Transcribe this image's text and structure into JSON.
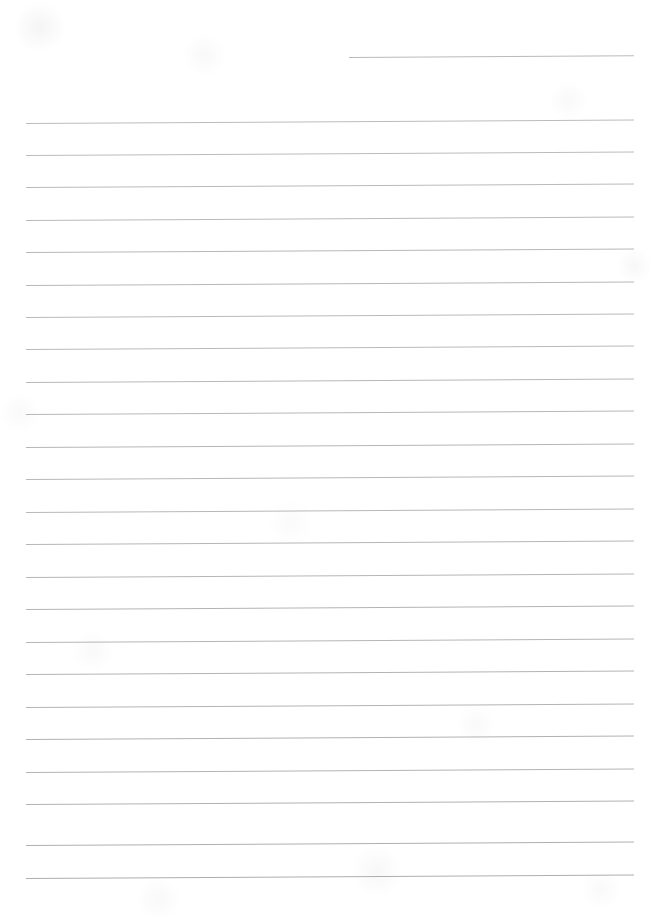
{
  "document": {
    "type": "scanned-ruled-paper",
    "title": "Blank ruled notebook page",
    "page_width": 661,
    "page_height": 917,
    "background_color": "#ffffff",
    "orientation": "portrait",
    "content_text": "",
    "handwriting_present": false
  },
  "ruling": {
    "style": "horizontal ruled lines",
    "line_color": "#b9b9bd",
    "line_color_faint": "#cfcfd4",
    "line_thickness_px": 1,
    "line_count_total": 25,
    "full_width_line_count": 24,
    "partial_line_count": 1,
    "left_margin_px": 26,
    "right_edge_px": 633,
    "line_spacing_px": 32.3,
    "first_line_y_px": 56,
    "last_line_y_px": 877,
    "skew_note": "lines tilt slightly upward to the right",
    "skew_rise_px": -3.5,
    "top_margin_px": 56,
    "bottom_margin_px": 40,
    "lines": [
      {
        "index": 1,
        "x": 349,
        "y": 57,
        "width": 285,
        "color": "#b9b9bd",
        "partial": true
      },
      {
        "index": 2,
        "x": 26,
        "y": 123,
        "width": 608,
        "color": "#bcbcc0",
        "partial": false
      },
      {
        "index": 3,
        "x": 26,
        "y": 155,
        "width": 608,
        "color": "#bcbcc0",
        "partial": false
      },
      {
        "index": 4,
        "x": 26,
        "y": 187,
        "width": 608,
        "color": "#bababe",
        "partial": false
      },
      {
        "index": 5,
        "x": 26,
        "y": 220,
        "width": 608,
        "color": "#bababe",
        "partial": false
      },
      {
        "index": 6,
        "x": 26,
        "y": 252,
        "width": 608,
        "color": "#b8b8bc",
        "partial": false
      },
      {
        "index": 7,
        "x": 26,
        "y": 285,
        "width": 608,
        "color": "#b8b8bc",
        "partial": false
      },
      {
        "index": 8,
        "x": 26,
        "y": 317,
        "width": 608,
        "color": "#bababe",
        "partial": false
      },
      {
        "index": 9,
        "x": 26,
        "y": 349,
        "width": 608,
        "color": "#bababe",
        "partial": false
      },
      {
        "index": 10,
        "x": 26,
        "y": 382,
        "width": 608,
        "color": "#b8b8bc",
        "partial": false
      },
      {
        "index": 11,
        "x": 26,
        "y": 414,
        "width": 608,
        "color": "#b8b8bc",
        "partial": false
      },
      {
        "index": 12,
        "x": 26,
        "y": 447,
        "width": 608,
        "color": "#b6b6ba",
        "partial": false
      },
      {
        "index": 13,
        "x": 26,
        "y": 479,
        "width": 608,
        "color": "#b8b8bc",
        "partial": false
      },
      {
        "index": 14,
        "x": 26,
        "y": 512,
        "width": 608,
        "color": "#b8b8bc",
        "partial": false
      },
      {
        "index": 15,
        "x": 26,
        "y": 544,
        "width": 608,
        "color": "#b6b6ba",
        "partial": false
      },
      {
        "index": 16,
        "x": 26,
        "y": 577,
        "width": 608,
        "color": "#b6b6ba",
        "partial": false
      },
      {
        "index": 17,
        "x": 26,
        "y": 609,
        "width": 608,
        "color": "#b4b4b8",
        "partial": false
      },
      {
        "index": 18,
        "x": 26,
        "y": 642,
        "width": 608,
        "color": "#b6b6ba",
        "partial": false
      },
      {
        "index": 19,
        "x": 26,
        "y": 674,
        "width": 608,
        "color": "#b4b4b8",
        "partial": false
      },
      {
        "index": 20,
        "x": 26,
        "y": 707,
        "width": 608,
        "color": "#b4b4b8",
        "partial": false
      },
      {
        "index": 21,
        "x": 26,
        "y": 739,
        "width": 608,
        "color": "#b2b2b6",
        "partial": false
      },
      {
        "index": 22,
        "x": 26,
        "y": 772,
        "width": 608,
        "color": "#b4b4b8",
        "partial": false
      },
      {
        "index": 23,
        "x": 26,
        "y": 804,
        "width": 608,
        "color": "#b2b2b6",
        "partial": false
      },
      {
        "index": 24,
        "x": 26,
        "y": 845,
        "width": 608,
        "color": "#b0b0b4",
        "partial": false
      },
      {
        "index": 25,
        "x": 26,
        "y": 878,
        "width": 608,
        "color": "#aeaeb2",
        "partial": false
      }
    ]
  }
}
